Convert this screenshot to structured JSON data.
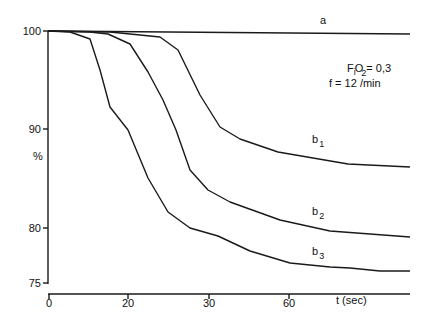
{
  "chart_data": {
    "type": "line",
    "title": "",
    "xlabel": "t (sec)",
    "ylabel": "%",
    "xlim": [
      0,
      90
    ],
    "ylim": [
      75,
      100
    ],
    "grid": false,
    "x_ticks": [
      {
        "label": "0",
        "value": 0,
        "px": 49
      },
      {
        "label": "20",
        "value": 20,
        "px": 128
      },
      {
        "label": "30",
        "value": 30,
        "px": 209
      },
      {
        "label": "60",
        "value": 60,
        "px": 289
      }
    ],
    "y_ticks": [
      {
        "label": "100",
        "value": 100,
        "py": 31
      },
      {
        "label": "90",
        "value": 90,
        "py": 129
      },
      {
        "label": "80",
        "value": 80,
        "py": 228
      },
      {
        "label": "75",
        "value": 75,
        "py": 283
      }
    ],
    "annotations": {
      "fio2_prefix": "F",
      "fio2_sub_i": "i",
      "fio2_o": "O",
      "fio2_sub_2": "2",
      "fio2_value": "= 0,3",
      "frequency": "f = 12 /min"
    },
    "series": [
      {
        "name": "a",
        "label_main": "a",
        "label_sub": "",
        "label_pos": [
          320,
          24
        ],
        "points_px": [
          [
            48,
            31
          ],
          [
            410,
            34
          ]
        ],
        "values": [
          {
            "t": 0,
            "pct": 100
          },
          {
            "t": 90,
            "pct": 99.7
          }
        ]
      },
      {
        "name": "b1",
        "label_main": "b",
        "label_sub": "1",
        "label_pos": [
          312,
          143
        ],
        "points_px": [
          [
            48,
            31
          ],
          [
            110,
            32
          ],
          [
            160,
            37
          ],
          [
            178,
            50
          ],
          [
            200,
            95
          ],
          [
            220,
            127
          ],
          [
            240,
            139
          ],
          [
            278,
            152
          ],
          [
            348,
            164
          ],
          [
            410,
            167
          ]
        ],
        "values": [
          {
            "t": 0,
            "pct": 100
          },
          {
            "t": 15.4,
            "pct": 99.9
          },
          {
            "t": 24,
            "pct": 99.5
          },
          {
            "t": 26.2,
            "pct": 98.1
          },
          {
            "t": 28.9,
            "pct": 93.5
          },
          {
            "t": 31.4,
            "pct": 90.2
          },
          {
            "t": 39,
            "pct": 89
          },
          {
            "t": 53,
            "pct": 87.7
          },
          {
            "t": 70,
            "pct": 86.5
          },
          {
            "t": 90,
            "pct": 86.2
          }
        ]
      },
      {
        "name": "b2",
        "label_main": "b",
        "label_sub": "2",
        "label_pos": [
          312,
          215
        ],
        "points_px": [
          [
            48,
            31
          ],
          [
            90,
            32
          ],
          [
            108,
            34
          ],
          [
            130,
            44
          ],
          [
            148,
            72
          ],
          [
            163,
            100
          ],
          [
            176,
            130
          ],
          [
            190,
            170
          ],
          [
            208,
            190
          ],
          [
            230,
            202
          ],
          [
            280,
            220
          ],
          [
            330,
            231
          ],
          [
            410,
            237
          ]
        ],
        "values": [
          {
            "t": 0,
            "pct": 100
          },
          {
            "t": 10.4,
            "pct": 99.9
          },
          {
            "t": 15,
            "pct": 99.7
          },
          {
            "t": 20,
            "pct": 98.7
          },
          {
            "t": 22.5,
            "pct": 95.8
          },
          {
            "t": 24.3,
            "pct": 93
          },
          {
            "t": 26,
            "pct": 90
          },
          {
            "t": 27.7,
            "pct": 85.9
          },
          {
            "t": 30,
            "pct": 83.9
          },
          {
            "t": 38,
            "pct": 82.6
          },
          {
            "t": 57,
            "pct": 80.8
          },
          {
            "t": 76,
            "pct": 79.7
          },
          {
            "t": 90,
            "pct": 79.1
          }
        ]
      },
      {
        "name": "b3",
        "label_main": "b",
        "label_sub": "3",
        "label_pos": [
          312,
          255
        ],
        "points_px": [
          [
            48,
            31
          ],
          [
            70,
            32
          ],
          [
            90,
            39
          ],
          [
            100,
            70
          ],
          [
            110,
            107
          ],
          [
            128,
            130
          ],
          [
            148,
            178
          ],
          [
            168,
            212
          ],
          [
            190,
            228
          ],
          [
            218,
            236
          ],
          [
            250,
            251
          ],
          [
            290,
            263
          ],
          [
            330,
            267
          ],
          [
            350,
            268
          ],
          [
            380,
            271
          ],
          [
            410,
            271
          ]
        ],
        "values": [
          {
            "t": 0,
            "pct": 100
          },
          {
            "t": 5.6,
            "pct": 99.9
          },
          {
            "t": 10.4,
            "pct": 99.2
          },
          {
            "t": 13,
            "pct": 96
          },
          {
            "t": 15.4,
            "pct": 92.3
          },
          {
            "t": 20,
            "pct": 89.9
          },
          {
            "t": 22.5,
            "pct": 85
          },
          {
            "t": 24.9,
            "pct": 81.6
          },
          {
            "t": 27.7,
            "pct": 80
          },
          {
            "t": 31.5,
            "pct": 79.2
          },
          {
            "t": 45,
            "pct": 77.7
          },
          {
            "t": 60,
            "pct": 76.5
          },
          {
            "t": 70,
            "pct": 76.1
          },
          {
            "t": 76,
            "pct": 76
          },
          {
            "t": 83,
            "pct": 75.7
          },
          {
            "t": 90,
            "pct": 75.7
          }
        ]
      }
    ],
    "axes_px": {
      "y_axis": {
        "x": 48,
        "y_top": 31,
        "y_bottom": 284
      },
      "x_axis": {
        "y": 294,
        "x_left": 48,
        "x_right": 410
      }
    }
  }
}
